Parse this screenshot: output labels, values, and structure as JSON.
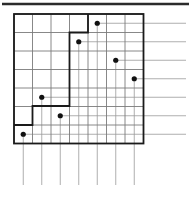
{
  "figure": {
    "type": "grid-diagram",
    "colors": {
      "grid_line": "#7a7a7a",
      "boundary_line": "#1a1a1a",
      "ray_line": "#9a9a9a",
      "dot_fill": "#111111",
      "top_rule": "#2b2b2b",
      "background": "#ffffff"
    },
    "grid": {
      "columns": 7,
      "rows": 7,
      "origin_x": 14,
      "origin_y": 14,
      "cell_width": 18.5,
      "cell_height": 18.5,
      "line_width": 0.9
    },
    "top_rule": {
      "x1": 2,
      "y1": 4,
      "x2": 189,
      "y2": 4,
      "width": 2.4
    },
    "dots": [
      {
        "label": "dot-1",
        "col": 5,
        "row": 1,
        "cx": 97.25,
        "cy": 23.25,
        "r": 2.6
      },
      {
        "label": "dot-2",
        "col": 4,
        "row": 2,
        "cx": 78.75,
        "cy": 41.75,
        "r": 2.6
      },
      {
        "label": "dot-3",
        "col": 6,
        "row": 3,
        "cx": 115.75,
        "cy": 60.25,
        "r": 2.6
      },
      {
        "label": "dot-4",
        "col": 7,
        "row": 4,
        "cx": 134.25,
        "cy": 78.75,
        "r": 2.6
      },
      {
        "label": "dot-5",
        "col": 2,
        "row": 5,
        "cx": 41.75,
        "cy": 97.25,
        "r": 2.6
      },
      {
        "label": "dot-6",
        "col": 3,
        "row": 6,
        "cx": 60.25,
        "cy": 115.75,
        "r": 2.6
      },
      {
        "label": "dot-7",
        "col": 1,
        "row": 7,
        "cx": 23.25,
        "cy": 134.25,
        "r": 2.6
      }
    ],
    "horizontal_rays": [
      {
        "label": "ray-h-1",
        "x1": 97.25,
        "y": 23.25,
        "x2": 186
      },
      {
        "label": "ray-h-2",
        "x1": 78.75,
        "y": 41.75,
        "x2": 186
      },
      {
        "label": "ray-h-3",
        "x1": 115.75,
        "y": 60.25,
        "x2": 186
      },
      {
        "label": "ray-h-4",
        "x1": 134.25,
        "y": 78.75,
        "x2": 186
      },
      {
        "label": "ray-h-5",
        "x1": 41.75,
        "y": 97.25,
        "x2": 186
      },
      {
        "label": "ray-h-6",
        "x1": 60.25,
        "y": 115.75,
        "x2": 186
      },
      {
        "label": "ray-h-7",
        "x1": 23.25,
        "y": 134.25,
        "x2": 186
      }
    ],
    "vertical_rays": [
      {
        "label": "ray-v-1",
        "x": 97.25,
        "y1": 23.25,
        "y2": 185
      },
      {
        "label": "ray-v-2",
        "x": 78.75,
        "y1": 41.75,
        "y2": 185
      },
      {
        "label": "ray-v-3",
        "x": 115.75,
        "y1": 60.25,
        "y2": 185
      },
      {
        "label": "ray-v-4",
        "x": 134.25,
        "y1": 78.75,
        "y2": 185
      },
      {
        "label": "ray-v-5",
        "x": 41.75,
        "y1": 97.25,
        "y2": 185
      },
      {
        "label": "ray-v-6",
        "x": 60.25,
        "y1": 115.75,
        "y2": 185
      },
      {
        "label": "ray-v-7",
        "x": 23.25,
        "y1": 134.25,
        "y2": 185
      }
    ],
    "boundary_path": "M 14 125 L 32.5 125 L 32.5 106 L 69.5 106 L 69.5 32.5 L 88 32.5 L 88 14 L 143 14 L 143 143 L 14 143 Z",
    "boundary_outline": "M 14 125 L 32.5 125 L 32.5 106 L 69.5 106 L 69.5 32.5 L 88 32.5 L 88 14",
    "boundary_width": 1.8,
    "grid_frame": {
      "x": 14,
      "y": 14,
      "w": 129.5,
      "h": 129.5
    }
  }
}
